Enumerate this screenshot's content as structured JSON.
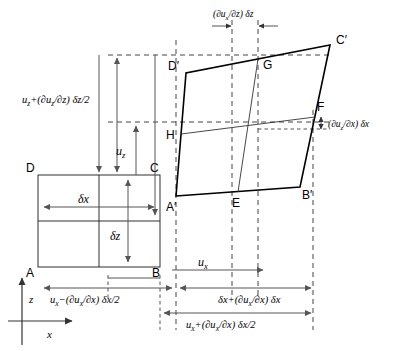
{
  "figure": {
    "vertices_original": [
      {
        "id": "A",
        "label": "A",
        "x": 38,
        "y": 267
      },
      {
        "id": "B",
        "label": "B",
        "x": 160,
        "y": 267
      },
      {
        "id": "C",
        "label": "C",
        "x": 160,
        "y": 175
      },
      {
        "id": "D",
        "label": "D",
        "x": 38,
        "y": 175
      }
    ],
    "vertices_deformed": [
      {
        "id": "Ap",
        "label": "A′",
        "x": 176,
        "y": 196
      },
      {
        "id": "Bp",
        "label": "B′",
        "x": 300,
        "y": 187
      },
      {
        "id": "Cp",
        "label": "C′",
        "x": 330,
        "y": 45
      },
      {
        "id": "Dp",
        "label": "D′",
        "x": 186,
        "y": 73
      },
      {
        "id": "E",
        "label": "E",
        "x": 238,
        "y": 192
      },
      {
        "id": "F",
        "label": "F",
        "x": 315,
        "y": 117
      },
      {
        "id": "G",
        "label": "G",
        "x": 258,
        "y": 59
      },
      {
        "id": "H",
        "label": "H",
        "x": 181,
        "y": 134
      }
    ],
    "axes": {
      "x_label": "x",
      "z_label": "z"
    },
    "dimension_labels": {
      "delta_x": "δx",
      "delta_z": "δz",
      "u_x": "u",
      "u_x_sub": "x",
      "u_z": "u",
      "u_z_sub": "z"
    },
    "annotations": {
      "uz_plus_half": "u₂+(∂u₂/∂z) δz/2",
      "uz_plus_half_parts": {
        "base": "u",
        "sub1": "z",
        "mid": "+(∂u",
        "sub2": "z",
        "tail": "/∂z) δz/2"
      },
      "dux_dz_deltaz": "(∂uₓ/∂z) δz",
      "duz_dx_deltax": "(∂u₂/∂x) δx",
      "ux_minus_half": "uₓ−(∂uₓ/∂x) δx/2",
      "deltax_plus": "δx+(∂uₓ/∂x) δx",
      "ux_plus_half": "uₓ+(∂uₓ/∂x) δx/2"
    }
  }
}
